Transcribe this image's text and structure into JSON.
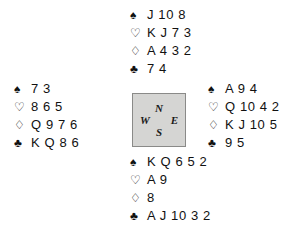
{
  "diagram": {
    "type": "bridge-deal",
    "suit_symbols": {
      "spades": "♠",
      "hearts": "♡",
      "diamonds": "♢",
      "clubs": "♣"
    },
    "compass": {
      "north": "N",
      "east": "E",
      "south": "S",
      "west": "W",
      "fill_color": "#d5d5d3",
      "border_color": "#8a8a88"
    },
    "hands": {
      "north": {
        "label": "North",
        "spades": "J 10 8",
        "hearts": "K J 7 3",
        "diamonds": "A 4 3 2",
        "clubs": "7 4"
      },
      "west": {
        "label": "West",
        "spades": "7 3",
        "hearts": "8 6 5",
        "diamonds": "Q 9 7 6",
        "clubs": "K Q 8 6"
      },
      "east": {
        "label": "East",
        "spades": "A 9 4",
        "hearts": "Q 10 4 2",
        "diamonds": "K J 10 5",
        "clubs": "9 5"
      },
      "south": {
        "label": "South",
        "spades": "K Q 6 5 2",
        "hearts": "A 9",
        "diamonds": "8",
        "clubs": "A J 10 3 2"
      }
    }
  }
}
